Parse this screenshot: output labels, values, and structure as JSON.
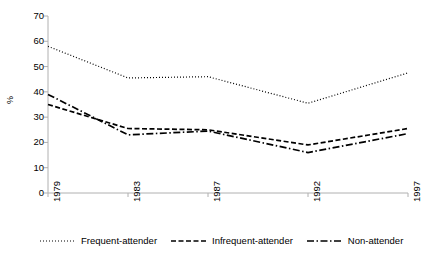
{
  "chart_data": {
    "type": "line",
    "title": "",
    "xlabel": "",
    "ylabel": "%",
    "categories": [
      "1979",
      "1983",
      "1987",
      "1992",
      "1997"
    ],
    "x": [
      1979,
      1983,
      1987,
      1992,
      1997
    ],
    "xlim": [
      1979,
      1997
    ],
    "ylim": [
      0,
      70
    ],
    "ytick_labels": [
      "70",
      "60",
      "50",
      "40",
      "30",
      "20",
      "10",
      "0"
    ],
    "ytick_values": [
      70,
      60,
      50,
      40,
      30,
      20,
      10,
      0
    ],
    "grid": false,
    "legend_position": "bottom",
    "series": [
      {
        "name": "Frequent-attender",
        "values": [
          58,
          45.5,
          46,
          35.5,
          47.5
        ],
        "style": "dotted",
        "color": "#000000"
      },
      {
        "name": "Infrequent-attender",
        "values": [
          35,
          25.5,
          25,
          19,
          25.5
        ],
        "style": "dashed",
        "color": "#000000"
      },
      {
        "name": "Non-attender",
        "values": [
          39,
          23,
          24.5,
          16,
          23.5
        ],
        "style": "dash-dot",
        "color": "#000000"
      }
    ]
  },
  "legend": {
    "entries": [
      {
        "label": "Frequent-attender"
      },
      {
        "label": "Infrequent-attender"
      },
      {
        "label": "Non-attender"
      }
    ]
  },
  "axes": {
    "y_label": "%"
  }
}
